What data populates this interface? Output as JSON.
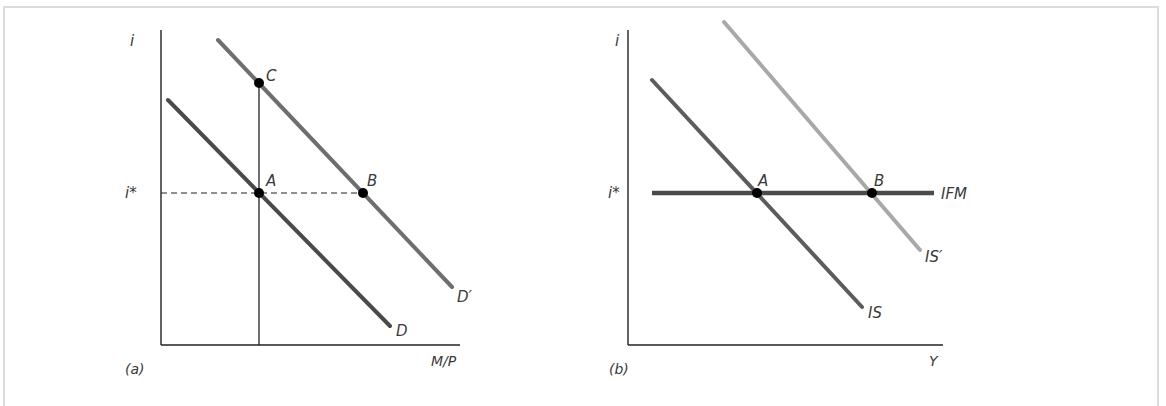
{
  "figure": {
    "panel_a": {
      "tag": "(a)",
      "y_axis_label": "i",
      "x_axis_label": "M/P",
      "reference_level_label": "i*",
      "curves": [
        {
          "name": "D",
          "label": "D",
          "color": "#4a4a4a"
        },
        {
          "name": "D_prime",
          "label": "D′",
          "color": "#6e6e6e"
        }
      ],
      "points": [
        {
          "label": "C"
        },
        {
          "label": "A"
        },
        {
          "label": "B"
        }
      ]
    },
    "panel_b": {
      "tag": "(b)",
      "y_axis_label": "i",
      "x_axis_label": "Y",
      "reference_level_label": "i*",
      "curves": [
        {
          "name": "IFM",
          "label": "IFM",
          "color": "#4a4a4a"
        },
        {
          "name": "IS",
          "label": "IS",
          "color": "#5c5c5c"
        },
        {
          "name": "IS_prime",
          "label": "IS′",
          "color": "#a8a8a8"
        }
      ],
      "points": [
        {
          "label": "A"
        },
        {
          "label": "B"
        }
      ]
    }
  }
}
